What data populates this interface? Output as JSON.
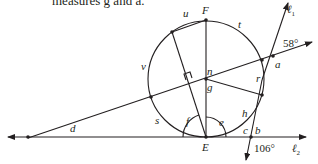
{
  "caption": "measures g and a.",
  "diagram": {
    "points": {
      "F": "F",
      "E": "E"
    },
    "arc_labels": {
      "u": "u",
      "t": "t",
      "v": "v",
      "s": "s",
      "h": "h",
      "r": "r"
    },
    "angle_labels": {
      "n": "n",
      "g": "g",
      "a": "a",
      "b": "b",
      "c": "c",
      "d": "d",
      "e": "e",
      "f": "f"
    },
    "given_angles": {
      "angle_58": "58°",
      "angle_106": "106°"
    },
    "lines": {
      "l1": "ℓ",
      "l1_sub": "1",
      "l2": "ℓ",
      "l2_sub": "2"
    },
    "colors": {
      "stroke": "#231f20",
      "background": "#ffffff"
    }
  }
}
